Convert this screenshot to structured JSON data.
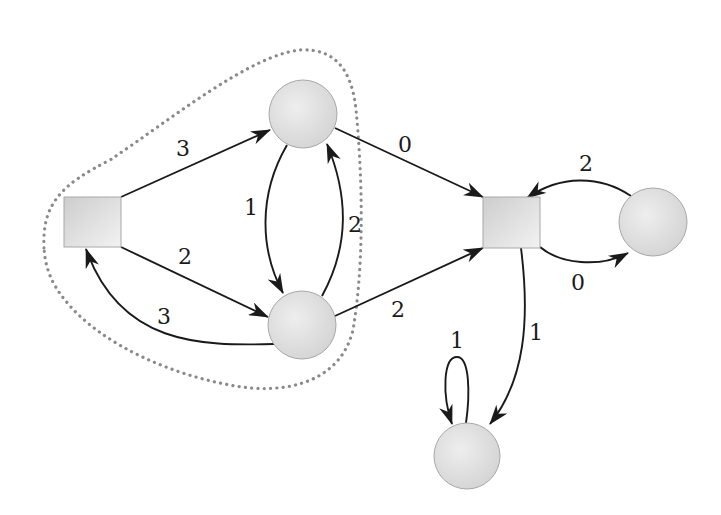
{
  "diagram": {
    "type": "weighted-directed-graph",
    "colors": {
      "edge": "#1a1a1a",
      "node_fill_light": "#ececec",
      "node_fill_dark": "#cfcfcf",
      "node_stroke": "#a8a8a8",
      "region_stroke": "#8a8a8a"
    },
    "nodes": [
      {
        "id": "A",
        "shape": "square",
        "x": 64,
        "y": 197,
        "w": 57,
        "h": 50
      },
      {
        "id": "B",
        "shape": "circle",
        "cx": 303,
        "cy": 114,
        "r": 34
      },
      {
        "id": "C",
        "shape": "circle",
        "cx": 302,
        "cy": 325,
        "r": 34
      },
      {
        "id": "D",
        "shape": "square",
        "x": 483,
        "y": 197,
        "w": 57,
        "h": 51
      },
      {
        "id": "E",
        "shape": "circle",
        "cx": 653,
        "cy": 222,
        "r": 34
      },
      {
        "id": "F",
        "shape": "circle",
        "cx": 467,
        "cy": 456,
        "r": 33
      }
    ],
    "edges": [
      {
        "from": "A",
        "to": "B",
        "weight": "3",
        "label_x": 183,
        "label_y": 148
      },
      {
        "from": "A",
        "to": "C",
        "weight": "2",
        "label_x": 185,
        "label_y": 256
      },
      {
        "from": "C",
        "to": "A",
        "weight": "3",
        "label_x": 164,
        "label_y": 316
      },
      {
        "from": "B",
        "to": "C",
        "weight": "1",
        "label_x": 251,
        "label_y": 207
      },
      {
        "from": "C",
        "to": "B",
        "weight": "2",
        "label_x": 355,
        "label_y": 224
      },
      {
        "from": "B",
        "to": "D",
        "weight": "0",
        "label_x": 405,
        "label_y": 144
      },
      {
        "from": "C",
        "to": "D",
        "weight": "2",
        "label_x": 398,
        "label_y": 309
      },
      {
        "from": "E",
        "to": "D",
        "weight": "2",
        "label_x": 586,
        "label_y": 163
      },
      {
        "from": "D",
        "to": "E",
        "weight": "0",
        "label_x": 578,
        "label_y": 282
      },
      {
        "from": "D",
        "to": "F",
        "weight": "1",
        "label_x": 536,
        "label_y": 332
      },
      {
        "from": "F",
        "to": "F",
        "weight": "1",
        "label_x": 457,
        "label_y": 340
      }
    ],
    "regions": [
      {
        "name": "dotted-cluster",
        "contains": [
          "A",
          "B",
          "C"
        ],
        "style": "dotted"
      }
    ]
  }
}
